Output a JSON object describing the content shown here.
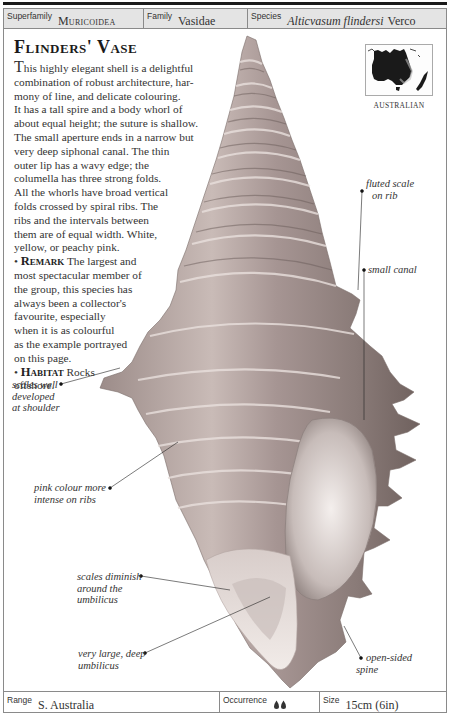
{
  "header": {
    "superfamily": {
      "label": "Superfamily",
      "value": "Muricoidea"
    },
    "family": {
      "label": "Family",
      "value": "Vasidae"
    },
    "species": {
      "label": "Species",
      "value_italic": "Alticvasum flindersi",
      "author": "Verco"
    }
  },
  "title": "Flinders' Vase",
  "description": {
    "dropcap": "T",
    "lines": [
      "his highly elegant shell is a delightful",
      "combination of robust architecture, har-",
      "mony of line, and delicate colouring.",
      "It has a tall spire and a body whorl of",
      "about equal height; the suture is shallow.",
      "The small aperture ends in a narrow but",
      "very deep siphonal canal. The thin",
      "outer lip has a wavy edge; the",
      "columella has three strong folds.",
      "All the whorls have broad vertical",
      "folds crossed by spiral ribs. The",
      "ribs and the intervals between",
      "them are of equal width. White,",
      "yellow, or peachy pink."
    ],
    "remark": {
      "bullet": "•",
      "heading": "Remark",
      "first_line": "The largest and",
      "lines": [
        "most spectacular member of",
        "the group, this species has",
        "always been a collector's",
        "favourite, especially",
        "when it is as colourful",
        "as the example portrayed",
        "on this page."
      ]
    },
    "habitat": {
      "bullet": "•",
      "heading": "Habitat",
      "first_line": "Rocks",
      "lines": [
        "offshore."
      ]
    }
  },
  "map": {
    "caption": "AUSTRALIAN",
    "land_color": "#1a1a1a"
  },
  "annotations": [
    {
      "id": "fluted-scale",
      "lines": [
        "fluted scale",
        "on rib"
      ]
    },
    {
      "id": "small-canal",
      "lines": [
        "small canal"
      ]
    },
    {
      "id": "scales-shoulder",
      "lines": [
        "scales well",
        "developed",
        "at shoulder"
      ]
    },
    {
      "id": "pink-colour",
      "lines": [
        "pink colour more",
        "intense on ribs"
      ]
    },
    {
      "id": "scales-diminish",
      "lines": [
        "scales diminish",
        "around the",
        "umbilicus"
      ]
    },
    {
      "id": "umbilicus",
      "lines": [
        "very large, deep",
        "umbilicus"
      ]
    },
    {
      "id": "open-spine",
      "lines": [
        "open-sided",
        "spine"
      ]
    }
  ],
  "footer": {
    "range": {
      "label": "Range",
      "value": "S. Australia"
    },
    "occurrence": {
      "label": "Occurrence",
      "icon": "two-drops-icon",
      "count": 2
    },
    "size": {
      "label": "Size",
      "value": "15cm (6in)"
    }
  },
  "colors": {
    "header_bg": "#e4e4e4",
    "border": "#8a8a8a",
    "shell_light": "#f2ece8",
    "shell_mid": "#b8aaa6",
    "shell_dark": "#6e5f5c"
  }
}
